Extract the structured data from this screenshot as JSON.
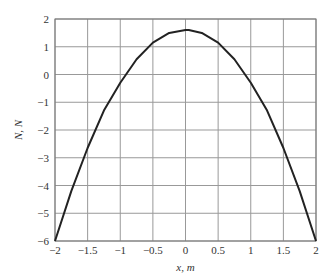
{
  "chart_data": {
    "type": "line",
    "title": "",
    "xlabel": "x, m",
    "ylabel": "N, N",
    "xlim": [
      -2,
      2
    ],
    "ylim": [
      -6,
      2
    ],
    "grid": true,
    "legend": null,
    "xticks": [
      -2,
      -1.5,
      -1,
      -0.5,
      0,
      0.5,
      1,
      1.5,
      2
    ],
    "xtick_labels": [
      "−2",
      "−1.5",
      "−1",
      "−0.5",
      "0",
      "0.5",
      "1",
      "1.5",
      "2"
    ],
    "yticks": [
      2,
      1,
      0,
      -1,
      -2,
      -3,
      -4,
      -5,
      -6
    ],
    "ytick_labels": [
      "2",
      "1",
      "0",
      "−1",
      "−2",
      "−3",
      "−4",
      "−5",
      "−6"
    ],
    "series": [
      {
        "name": "N(x)",
        "color": "#222222",
        "x": [
          -2,
          -1.75,
          -1.5,
          -1.25,
          -1,
          -0.75,
          -0.5,
          -0.25,
          0,
          0.05,
          0.25,
          0.5,
          0.75,
          1,
          1.25,
          1.5,
          1.75,
          2
        ],
        "y": [
          -6.0,
          -4.2,
          -2.65,
          -1.3,
          -0.3,
          0.55,
          1.15,
          1.5,
          1.6,
          1.6,
          1.5,
          1.15,
          0.55,
          -0.3,
          -1.3,
          -2.65,
          -4.2,
          -6.0
        ]
      }
    ]
  }
}
